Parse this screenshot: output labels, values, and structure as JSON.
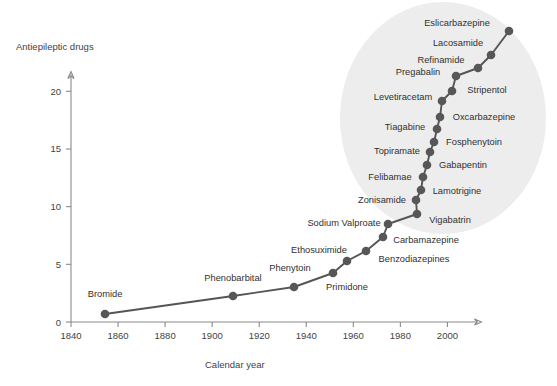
{
  "chart_data": {
    "type": "line",
    "title": "",
    "xlabel": "Calendar year",
    "ylabel": "Antiepileptic drugs",
    "xlim": [
      1840,
      2015
    ],
    "ylim": [
      0,
      21.5
    ],
    "grid": false,
    "legend": "none",
    "xticks": [
      "1840",
      "1860",
      "1880",
      "1900",
      "1920",
      "1940",
      "1960",
      "1980",
      "2000"
    ],
    "xtick_values": [
      1840,
      1860,
      1880,
      1900,
      1920,
      1940,
      1960,
      1980,
      2000
    ],
    "yticks": [
      "0",
      "5",
      "10",
      "15",
      "20"
    ],
    "ytick_values": [
      0,
      5,
      10,
      15,
      20
    ],
    "annotation_region": {
      "name": "modern-era-highlight",
      "shape": "ellipse",
      "color": "#ededed"
    },
    "x": [
      1858,
      1912,
      1936,
      1953,
      1958,
      1963,
      1968,
      1973,
      1974,
      1978,
      1989,
      1990,
      1991,
      1993,
      1994,
      1995,
      1996,
      1997,
      1999,
      2000,
      2001,
      2004,
      2005,
      2007,
      2009,
      2011
    ],
    "values": [
      1,
      2,
      3,
      4,
      5,
      6,
      7,
      8,
      9,
      10,
      11,
      12,
      13,
      14,
      15,
      16,
      17,
      18,
      19,
      20,
      21,
      22,
      23,
      24,
      25,
      26
    ],
    "points": [
      {
        "label": "Bromide",
        "year": 1858,
        "count": 1,
        "px": 105,
        "py": 314,
        "lx": 105,
        "ly": 297,
        "anchor": "middle"
      },
      {
        "label": "Phenobarbital",
        "year": 1912,
        "count": 2,
        "px": 233,
        "py": 296,
        "lx": 233,
        "ly": 281,
        "anchor": "middle"
      },
      {
        "label": "Phenytoin",
        "year": 1936,
        "count": 3,
        "px": 294,
        "py": 287,
        "lx": 290,
        "ly": 271,
        "anchor": "middle"
      },
      {
        "label": "Primidone",
        "year": 1953,
        "count": 4,
        "px": 333,
        "py": 273,
        "lx": 347,
        "ly": 290,
        "anchor": "middle"
      },
      {
        "label": "Ethosuximide",
        "year": 1958,
        "count": 5,
        "px": 347,
        "py": 261,
        "lx": 319,
        "ly": 253,
        "anchor": "middle"
      },
      {
        "label": "Benzodiazepines",
        "year": 1968,
        "count": 6,
        "px": 366,
        "py": 251,
        "lx": 414,
        "ly": 262,
        "anchor": "middle"
      },
      {
        "label": "Carbamazepine",
        "year": 1974,
        "count": 7,
        "px": 383,
        "py": 237,
        "lx": 426,
        "ly": 243,
        "anchor": "middle"
      },
      {
        "label": "Sodium Valproate",
        "year": 1978,
        "count": 8,
        "px": 388,
        "py": 224,
        "lx": 344,
        "ly": 226,
        "anchor": "middle"
      },
      {
        "label": "Vigabatrin",
        "year": 1989,
        "count": 9,
        "px": 417,
        "py": 214,
        "lx": 450,
        "ly": 223,
        "anchor": "middle"
      },
      {
        "label": "Zonisamide",
        "year": 1990,
        "count": 10,
        "px": 416,
        "py": 200,
        "lx": 382,
        "ly": 203,
        "anchor": "middle"
      },
      {
        "label": "Lamotrigine",
        "year": 1991,
        "count": 11,
        "px": 421,
        "py": 190,
        "lx": 457,
        "ly": 194,
        "anchor": "middle"
      },
      {
        "label": "Felibamae",
        "year": 1993,
        "count": 12,
        "px": 423,
        "py": 177,
        "lx": 390,
        "ly": 180,
        "anchor": "middle"
      },
      {
        "label": "Gabapentin",
        "year": 1994,
        "count": 13,
        "px": 427,
        "py": 165,
        "lx": 463,
        "ly": 168,
        "anchor": "middle"
      },
      {
        "label": "Topiramate",
        "year": 1995,
        "count": 14,
        "px": 430,
        "py": 152,
        "lx": 397,
        "ly": 154,
        "anchor": "middle"
      },
      {
        "label": "Fosphenytoin",
        "year": 1996,
        "count": 15,
        "px": 434,
        "py": 142,
        "lx": 474,
        "ly": 145,
        "anchor": "middle"
      },
      {
        "label": "Tiagabine",
        "year": 1997,
        "count": 16,
        "px": 437,
        "py": 129,
        "lx": 405,
        "ly": 130,
        "anchor": "middle"
      },
      {
        "label": "Oxcarbazepine",
        "year": 1999,
        "count": 17,
        "px": 440,
        "py": 117,
        "lx": 484,
        "ly": 120,
        "anchor": "middle"
      },
      {
        "label": "Levetiracetam",
        "year": 2000,
        "count": 18,
        "px": 442,
        "py": 101,
        "lx": 403,
        "ly": 100,
        "anchor": "middle"
      },
      {
        "label": "Stripentol",
        "year": 2001,
        "count": 19,
        "px": 452,
        "py": 91,
        "lx": 487,
        "ly": 93,
        "anchor": "middle"
      },
      {
        "label": "Pregabalin",
        "year": 2004,
        "count": 20,
        "px": 456,
        "py": 76,
        "lx": 418,
        "ly": 75,
        "anchor": "middle"
      },
      {
        "label": "Refinamide",
        "year": 2005,
        "count": 21,
        "px": 478,
        "py": 68,
        "lx": 441,
        "ly": 63,
        "anchor": "middle"
      },
      {
        "label": "Lacosamide",
        "year": 2007,
        "count": 22,
        "px": 491,
        "py": 55,
        "lx": 458,
        "ly": 46,
        "anchor": "middle"
      },
      {
        "label": "Eslicarbazepine",
        "year": 2011,
        "count": 23,
        "px": 509,
        "py": 31,
        "lx": 457,
        "ly": 26,
        "anchor": "middle"
      }
    ]
  },
  "caption": {
    "text": ""
  }
}
